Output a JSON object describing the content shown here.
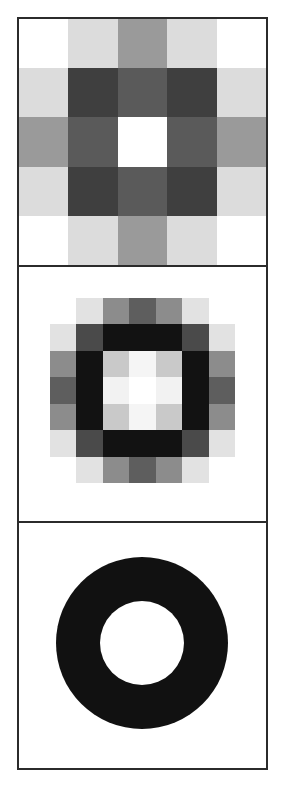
{
  "figure": {
    "background_color": "#ffffff",
    "frame_color": "#2b2b2b",
    "frame_width_px": 2,
    "width_px": 285,
    "height_px": 788
  },
  "panels": [
    {
      "name": "checkerboard-5x5",
      "kind": "pixel-grid",
      "height_px": 246,
      "columns": 5,
      "rows": 5,
      "cells": [
        [
          "#ffffff",
          "#dcdcdc",
          "#9a9a9a",
          "#dcdcdc",
          "#ffffff"
        ],
        [
          "#dcdcdc",
          "#3f3f3f",
          "#5a5a5a",
          "#3f3f3f",
          "#dcdcdc"
        ],
        [
          "#9a9a9a",
          "#5a5a5a",
          "#ffffff",
          "#5a5a5a",
          "#9a9a9a"
        ],
        [
          "#dcdcdc",
          "#3f3f3f",
          "#5a5a5a",
          "#3f3f3f",
          "#dcdcdc"
        ],
        [
          "#ffffff",
          "#dcdcdc",
          "#9a9a9a",
          "#dcdcdc",
          "#ffffff"
        ]
      ]
    },
    {
      "name": "concentric-square-7x7",
      "kind": "pixel-grid",
      "height_px": 256,
      "columns": 7,
      "rows": 7,
      "inset": {
        "left_px": 31,
        "top_px": 31,
        "size_px": 185
      },
      "cells": [
        [
          "#ffffff",
          "#e2e2e2",
          "#8c8c8c",
          "#5e5e5e",
          "#8c8c8c",
          "#e2e2e2",
          "#ffffff"
        ],
        [
          "#e2e2e2",
          "#4a4a4a",
          "#121212",
          "#121212",
          "#121212",
          "#4a4a4a",
          "#e2e2e2"
        ],
        [
          "#8c8c8c",
          "#121212",
          "#c9c9c9",
          "#f5f5f5",
          "#c9c9c9",
          "#121212",
          "#8c8c8c"
        ],
        [
          "#5e5e5e",
          "#121212",
          "#f2f2f2",
          "#ffffff",
          "#f2f2f2",
          "#121212",
          "#5e5e5e"
        ],
        [
          "#8c8c8c",
          "#121212",
          "#c9c9c9",
          "#f5f5f5",
          "#c9c9c9",
          "#121212",
          "#8c8c8c"
        ],
        [
          "#e2e2e2",
          "#4a4a4a",
          "#121212",
          "#121212",
          "#121212",
          "#4a4a4a",
          "#e2e2e2"
        ],
        [
          "#ffffff",
          "#e2e2e2",
          "#8c8c8c",
          "#5e5e5e",
          "#8c8c8c",
          "#e2e2e2",
          "#ffffff"
        ]
      ]
    },
    {
      "name": "annulus-ring",
      "kind": "annulus",
      "height_px": 247,
      "ring_color": "#111111",
      "hole_color": "#ffffff",
      "outer_diameter_px": 172,
      "inner_diameter_px": 84,
      "center_x_px": 123,
      "center_y_px": 120
    }
  ],
  "chart_data": {
    "type": "heatmap",
    "title": "",
    "subtitle": "",
    "xlabel": "",
    "ylabel": "",
    "grid": false,
    "legend": "none",
    "colormap": "grayscale",
    "value_range": [
      0,
      255
    ],
    "panels": [
      {
        "name": "checkerboard-5x5",
        "type": "heatmap",
        "shape": [
          5,
          5
        ],
        "x": [
          0,
          1,
          2,
          3,
          4
        ],
        "y": [
          0,
          1,
          2,
          3,
          4
        ],
        "values": [
          [
            255,
            220,
            154,
            220,
            255
          ],
          [
            220,
            63,
            90,
            63,
            220
          ],
          [
            154,
            90,
            255,
            90,
            154
          ],
          [
            220,
            63,
            90,
            63,
            220
          ],
          [
            255,
            220,
            154,
            220,
            255
          ]
        ]
      },
      {
        "name": "concentric-square-7x7",
        "type": "heatmap",
        "shape": [
          7,
          7
        ],
        "x": [
          0,
          1,
          2,
          3,
          4,
          5,
          6
        ],
        "y": [
          0,
          1,
          2,
          3,
          4,
          5,
          6
        ],
        "values": [
          [
            255,
            226,
            140,
            94,
            140,
            226,
            255
          ],
          [
            226,
            74,
            18,
            18,
            18,
            74,
            226
          ],
          [
            140,
            18,
            201,
            245,
            201,
            18,
            140
          ],
          [
            94,
            18,
            242,
            255,
            242,
            18,
            94
          ],
          [
            140,
            18,
            201,
            245,
            201,
            18,
            140
          ],
          [
            226,
            74,
            18,
            18,
            18,
            74,
            226
          ],
          [
            255,
            226,
            140,
            94,
            140,
            226,
            255
          ]
        ]
      },
      {
        "name": "annulus-ring",
        "type": "heatmap",
        "shape": "continuous",
        "description": "black annulus on white field",
        "outer_radius": 86,
        "inner_radius": 42,
        "ring_value": 17,
        "background_value": 255
      }
    ]
  }
}
